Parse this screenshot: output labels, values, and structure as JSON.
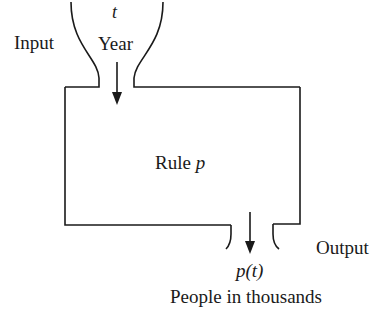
{
  "diagram": {
    "type": "function machine",
    "input": {
      "side_label": "Input",
      "variable": "t",
      "description": "Year"
    },
    "rule": {
      "label_prefix": "Rule ",
      "label_name": "p"
    },
    "output": {
      "side_label": "Output",
      "expression": "p(t)",
      "description": "People in thousands"
    },
    "colors": {
      "stroke": "#1a1a1a",
      "background": "#ffffff",
      "text": "#1a1a1a"
    }
  }
}
